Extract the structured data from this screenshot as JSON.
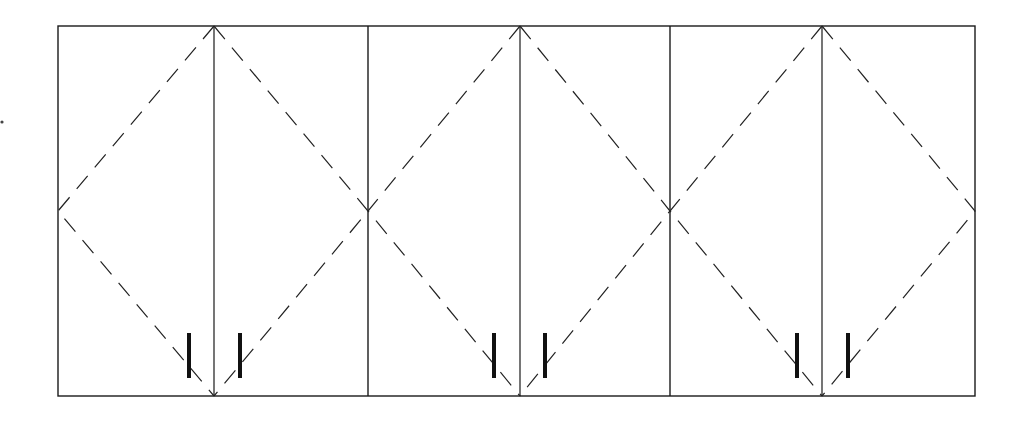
{
  "drawing": {
    "type": "cabinet-door-elevation",
    "description": "Three double-door wall cabinets in elevation with dashed door-swing lines and pull handles",
    "canvas": {
      "width": 1026,
      "height": 423
    },
    "frame": {
      "x1": 58,
      "y1": 26,
      "x2": 975,
      "y2": 396
    },
    "line_color": "#1a1a1a",
    "cabinets": [
      {
        "id": "cabinet-1",
        "left": 58,
        "right": 368,
        "center": 214,
        "doors": [
          "left-door",
          "right-door"
        ],
        "handles": [
          189,
          240
        ]
      },
      {
        "id": "cabinet-2",
        "left": 368,
        "right": 670,
        "center": 520,
        "doors": [
          "left-door",
          "right-door"
        ],
        "handles": [
          494,
          545
        ]
      },
      {
        "id": "cabinet-3",
        "left": 670,
        "right": 975,
        "center": 822,
        "doors": [
          "left-door",
          "right-door"
        ],
        "handles": [
          797,
          848
        ]
      }
    ],
    "handle_span": {
      "y1": 333,
      "y2": 378
    },
    "swing_apex_y": {
      "top": 26,
      "mid": 211,
      "bottom": 396
    },
    "artifact_dot": {
      "x": 2,
      "y": 122
    }
  }
}
